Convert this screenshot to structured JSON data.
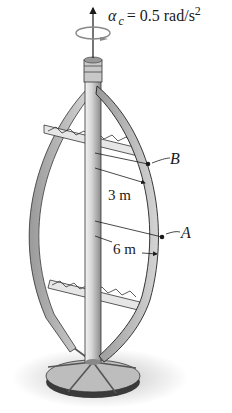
{
  "figure": {
    "angular_acceleration": {
      "symbol": "α",
      "subscript": "c",
      "equals": "= 0.5 rad/s",
      "exponent": "2"
    },
    "points": [
      {
        "label": "B",
        "distance_label": "3 m"
      },
      {
        "label": "A",
        "distance_label": "6 m"
      }
    ],
    "colors": {
      "ink": "#1a1a1a",
      "blade_fill": "#bdbdbd",
      "shaft_fill": "#d6d6d6",
      "shadow": "#cfcfcf"
    }
  }
}
